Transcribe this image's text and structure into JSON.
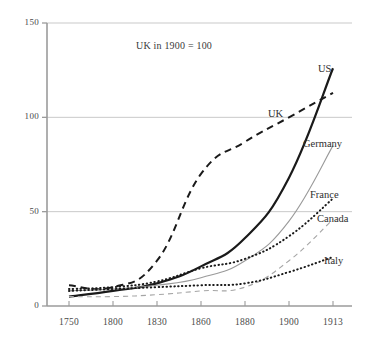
{
  "chart_data": {
    "type": "line",
    "title": "",
    "note": "UK in 1900 = 100",
    "xlabel": "",
    "ylabel": "",
    "categories": [
      "1750",
      "1800",
      "1830",
      "1860",
      "1880",
      "1900",
      "1913"
    ],
    "ylim": [
      0,
      150
    ],
    "yticks": [
      0,
      50,
      100,
      150
    ],
    "ytick_labels": [
      "0",
      "50",
      "100",
      "150"
    ],
    "grid": "horizontal",
    "legend_position": "inline-right-end-of-line",
    "series": [
      {
        "name": "US",
        "values": [
          5,
          8,
          12,
          21,
          36,
          68,
          126
        ],
        "style": "solid",
        "color": "#1a1a1a",
        "width": 2.2,
        "label_x": 318,
        "label_y": 63
      },
      {
        "name": "UK",
        "values": [
          11,
          10,
          24,
          70,
          87,
          100,
          113
        ],
        "style": "dashed",
        "color": "#1a1a1a",
        "width": 2.0,
        "label_x": 268,
        "label_y": 108
      },
      {
        "name": "Germany",
        "values": [
          8,
          9,
          11,
          15,
          24,
          45,
          85
        ],
        "style": "solid",
        "color": "#9a9a9a",
        "width": 1.1,
        "label_x": 303,
        "label_y": 138
      },
      {
        "name": "France",
        "values": [
          9,
          10,
          13,
          20,
          25,
          37,
          57
        ],
        "style": "dotted",
        "color": "#1a1a1a",
        "width": 2.0,
        "label_x": 310,
        "label_y": 189
      },
      {
        "name": "Canada",
        "values": [
          5,
          5,
          6,
          8,
          10,
          24,
          46
        ],
        "style": "dashed",
        "color": "#a5a5a5",
        "width": 1.1,
        "label_x": 317,
        "label_y": 213
      },
      {
        "name": "Italy",
        "values": [
          8,
          9,
          10,
          11,
          12,
          18,
          26
        ],
        "style": "dotted",
        "color": "#1a1a1a",
        "width": 2.0,
        "label_x": 324,
        "label_y": 255
      }
    ]
  },
  "axes": {
    "y_tick_labels": [
      "150",
      "100",
      "50",
      "0"
    ],
    "x_tick_labels": [
      "1750",
      "1800",
      "1830",
      "1860",
      "1880",
      "1900",
      "1913"
    ]
  },
  "colors": {
    "axis": "#9b9b9b",
    "grid": "#c9c9c9",
    "ink": "#1a1a1a",
    "ink_light": "#9a9a9a",
    "background": "#ffffff"
  }
}
